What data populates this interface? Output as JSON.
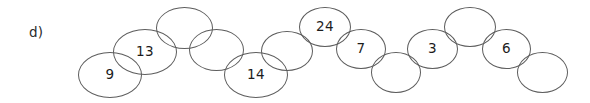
{
  "worksheet": {
    "item_label": "d)",
    "background_color": "#ffffff",
    "outline_color": "#5d5d5d",
    "text_color": "#1c1c1c"
  },
  "chain": {
    "name": "overlapping-ellipse-chain",
    "count": 13,
    "nodes": [
      {
        "id": "node-1",
        "value": "9",
        "x": 78,
        "y": 52,
        "w": 64,
        "h": 46
      },
      {
        "id": "node-2",
        "value": "13",
        "x": 113,
        "y": 29,
        "w": 64,
        "h": 46
      },
      {
        "id": "node-3",
        "value": "",
        "x": 156,
        "y": 7,
        "w": 57,
        "h": 42
      },
      {
        "id": "node-4",
        "value": "",
        "x": 189,
        "y": 29,
        "w": 55,
        "h": 42
      },
      {
        "id": "node-5",
        "value": "14",
        "x": 224,
        "y": 52,
        "w": 64,
        "h": 46
      },
      {
        "id": "node-6",
        "value": "",
        "x": 261,
        "y": 31,
        "w": 52,
        "h": 40
      },
      {
        "id": "node-7",
        "value": "24",
        "x": 299,
        "y": 7,
        "w": 52,
        "h": 40
      },
      {
        "id": "node-8",
        "value": "7",
        "x": 336,
        "y": 29,
        "w": 50,
        "h": 40
      },
      {
        "id": "node-9",
        "value": "",
        "x": 371,
        "y": 52,
        "w": 50,
        "h": 41
      },
      {
        "id": "node-10",
        "value": "3",
        "x": 407,
        "y": 29,
        "w": 51,
        "h": 40
      },
      {
        "id": "node-11",
        "value": "",
        "x": 444,
        "y": 7,
        "w": 52,
        "h": 40
      },
      {
        "id": "node-12",
        "value": "6",
        "x": 482,
        "y": 29,
        "w": 49,
        "h": 40
      },
      {
        "id": "node-13",
        "value": "",
        "x": 517,
        "y": 52,
        "w": 51,
        "h": 41
      }
    ]
  }
}
